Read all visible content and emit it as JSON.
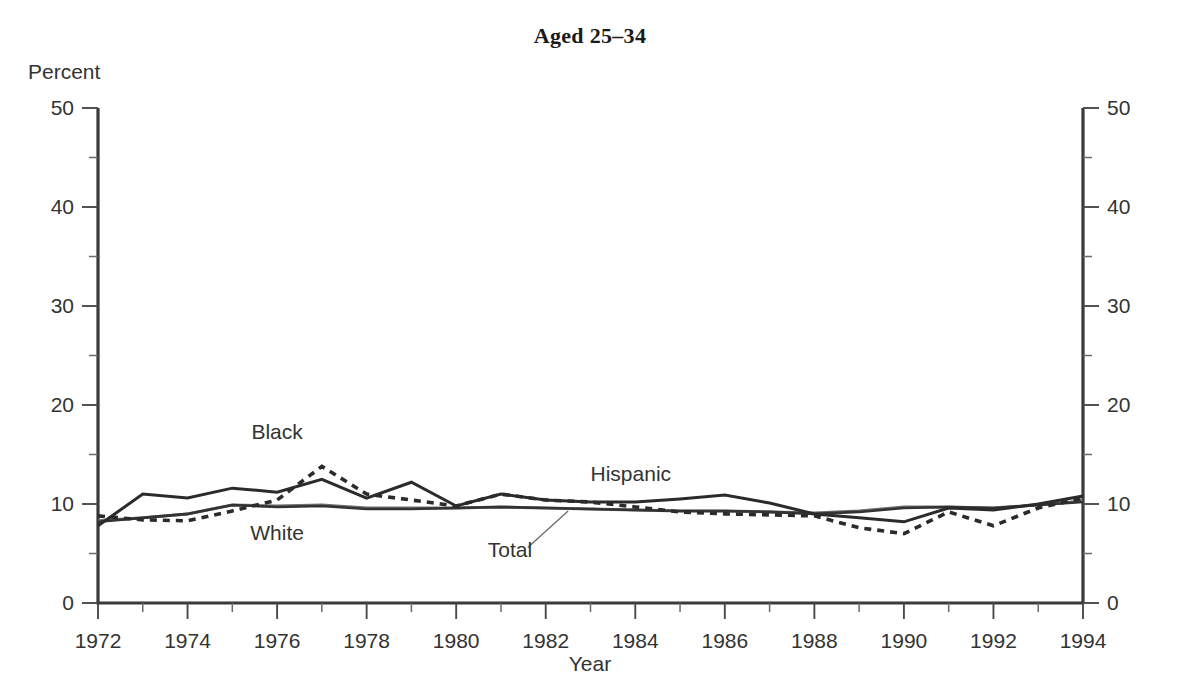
{
  "chart_data": {
    "type": "line",
    "title": "Aged 25–34",
    "xlabel": "Year",
    "ylabel": "Percent",
    "xlim": [
      1972,
      1994
    ],
    "ylim": [
      0,
      50
    ],
    "ytick_labels": [
      "0",
      "10",
      "20",
      "30",
      "40",
      "50"
    ],
    "ytick_values": [
      0,
      10,
      20,
      30,
      40,
      50
    ],
    "yminor_values": [
      5,
      15,
      25,
      35,
      45
    ],
    "xtick_labels": [
      "1972",
      "1974",
      "1976",
      "1978",
      "1980",
      "1982",
      "1984",
      "1986",
      "1988",
      "1990",
      "1992",
      "1994"
    ],
    "xtick_values": [
      1972,
      1974,
      1976,
      1978,
      1980,
      1982,
      1984,
      1986,
      1988,
      1990,
      1992,
      1994
    ],
    "grid": false,
    "legend_position": "inline-annotations",
    "x": [
      1972,
      1973,
      1974,
      1975,
      1976,
      1977,
      1978,
      1979,
      1980,
      1981,
      1982,
      1983,
      1984,
      1985,
      1986,
      1987,
      1988,
      1989,
      1990,
      1991,
      1992,
      1993,
      1994
    ],
    "series": [
      {
        "name": "Hispanic",
        "style": "solid",
        "values": [
          7.8,
          11.0,
          10.6,
          11.6,
          11.2,
          12.5,
          10.6,
          12.2,
          9.8,
          11.0,
          10.4,
          10.2,
          10.2,
          10.5,
          10.9,
          10.1,
          9.0,
          8.6,
          8.2,
          9.6,
          9.4,
          10.0,
          10.8
        ]
      },
      {
        "name": "Black",
        "style": "dotted",
        "values": [
          8.8,
          8.4,
          8.3,
          9.3,
          10.4,
          13.8,
          11.0,
          10.4,
          9.8,
          11.0,
          10.4,
          10.2,
          9.7,
          9.2,
          9.0,
          8.9,
          8.8,
          7.6,
          7.0,
          9.2,
          7.8,
          9.6,
          10.6
        ]
      },
      {
        "name": "White",
        "style": "solid",
        "values": [
          8.2,
          8.6,
          9.0,
          9.9,
          9.7,
          9.8,
          9.5,
          9.5,
          9.6,
          9.7,
          9.6,
          9.5,
          9.4,
          9.3,
          9.3,
          9.2,
          9.0,
          9.2,
          9.6,
          9.7,
          9.6,
          9.9,
          10.2
        ]
      },
      {
        "name": "Total",
        "style": "solid",
        "values": [
          8.3,
          8.6,
          9.0,
          9.9,
          9.8,
          9.9,
          9.6,
          9.6,
          9.6,
          9.7,
          9.6,
          9.5,
          9.4,
          9.3,
          9.3,
          9.2,
          9.1,
          9.3,
          9.7,
          9.7,
          9.6,
          9.9,
          10.3
        ]
      }
    ],
    "annotations": [
      {
        "text": "Black",
        "x": 1976.0,
        "y": 16.6
      },
      {
        "text": "White",
        "x": 1976.0,
        "y": 6.4
      },
      {
        "text": "Total",
        "x": 1981.2,
        "y": 4.6
      },
      {
        "text": "Hispanic",
        "x": 1983.9,
        "y": 12.3
      }
    ],
    "annotation_leaders": [
      {
        "from_x": 1981.6,
        "from_y": 5.6,
        "to_x": 1982.5,
        "to_y": 9.3
      }
    ]
  }
}
